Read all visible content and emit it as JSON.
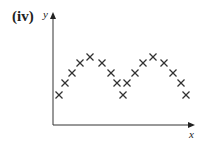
{
  "figure": {
    "label": "(iv)"
  },
  "chart_data": {
    "type": "scatter",
    "title": "(iv)",
    "xlabel": "x",
    "ylabel": "y",
    "grid": false,
    "marker": "x",
    "axis_ticks": "none",
    "points_pixel": [
      [
        59,
        95
      ],
      [
        65,
        83
      ],
      [
        72,
        73
      ],
      [
        80,
        63
      ],
      [
        90,
        57
      ],
      [
        102,
        63
      ],
      [
        111,
        73
      ],
      [
        117,
        83
      ],
      [
        123,
        95
      ],
      [
        127,
        83
      ],
      [
        135,
        73
      ],
      [
        143,
        63
      ],
      [
        153,
        57
      ],
      [
        164,
        63
      ],
      [
        173,
        73
      ],
      [
        181,
        83
      ],
      [
        186,
        95
      ]
    ],
    "points_relative": {
      "x": [
        0.04,
        0.08,
        0.13,
        0.19,
        0.26,
        0.35,
        0.41,
        0.45,
        0.49,
        0.52,
        0.58,
        0.63,
        0.7,
        0.78,
        0.85,
        0.9,
        0.94
      ],
      "y": [
        0.27,
        0.38,
        0.47,
        0.56,
        0.62,
        0.56,
        0.47,
        0.38,
        0.27,
        0.38,
        0.47,
        0.56,
        0.62,
        0.56,
        0.47,
        0.38,
        0.27
      ]
    }
  },
  "colors": {
    "axis": "#333333",
    "marker": "#333333",
    "background": "#ffffff"
  }
}
